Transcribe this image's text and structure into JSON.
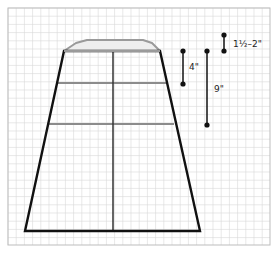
{
  "diagram": {
    "grid": {
      "x": 8,
      "y": 8,
      "width": 262,
      "height": 237,
      "spacing": 8.2,
      "line_color": "#d9d9d9",
      "border_color": "#bdbdbd"
    },
    "colors": {
      "outline": "#111111",
      "guide": "#8c8c8c",
      "cap_fill": "#eeeeee",
      "cap_stroke": "#9a9a9a",
      "dot": "#111111"
    },
    "shape": {
      "top_left": [
        64,
        51
      ],
      "top_right": [
        160,
        51
      ],
      "bottom_left": [
        25,
        231
      ],
      "bottom_right": [
        200,
        231
      ],
      "center_x": 113,
      "cap_points": "64,51 76,43 87,40 143,40 152,43 160,51"
    },
    "guide_lines": [
      {
        "y": 83,
        "x1": 57,
        "x2": 167
      },
      {
        "y": 124,
        "x1": 48,
        "x2": 174
      }
    ],
    "measurements": [
      {
        "id": "top-height",
        "label": "1½–2\"",
        "x": 224,
        "y1": 35,
        "y2": 51,
        "label_x": 233,
        "label_y": 47
      },
      {
        "id": "first-band",
        "label": "4\"",
        "x": 183,
        "y1": 51,
        "y2": 84,
        "label_x": 189,
        "label_y": 70
      },
      {
        "id": "second-band",
        "label": "9\"",
        "x": 207,
        "y1": 51,
        "y2": 125,
        "label_x": 214,
        "label_y": 92
      }
    ]
  }
}
